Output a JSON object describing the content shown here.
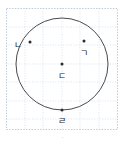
{
  "figure": {
    "background_color": "#ffffff",
    "grid": {
      "line_color": "#c3d4e6",
      "minor_line_color": "#dce6f0",
      "border_color": "#b9c9da",
      "spacing_px": 18,
      "style": "dotted"
    },
    "circle": {
      "stroke_color": "#4a4a4a",
      "stroke_width": 1,
      "fill": "none",
      "center_x": 56,
      "center_y": 56,
      "radius": 46
    },
    "point_color": "#2b2b2b",
    "label_color": "#1d1d1d"
  },
  "points": [
    {
      "id": "point-giyeok",
      "label": "ㄱ",
      "x": 78,
      "y": 33,
      "label_x": 78,
      "label_y": 45,
      "on_circle": false,
      "description": "interior point upper right"
    },
    {
      "id": "point-nieun",
      "label": "ㄴ",
      "x": 24,
      "y": 34,
      "label_x": 12,
      "label_y": 37,
      "on_circle": true,
      "description": "point on circle upper left"
    },
    {
      "id": "point-digeut",
      "label": "ㄷ",
      "x": 56,
      "y": 56,
      "label_x": 56,
      "label_y": 68,
      "on_circle": false,
      "description": "center of the circle"
    },
    {
      "id": "point-rieul",
      "label": "ㄹ",
      "x": 56,
      "y": 102,
      "label_x": 56,
      "label_y": 113,
      "on_circle": true,
      "description": "point on circle at bottom"
    }
  ],
  "caption": {
    "mark": "·"
  }
}
